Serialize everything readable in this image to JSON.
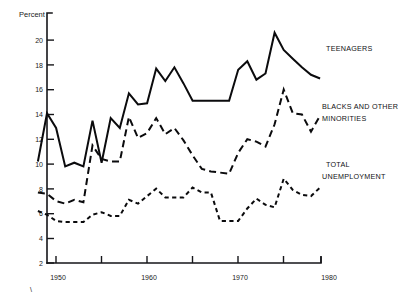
{
  "chart_data": {
    "type": "line",
    "title": "",
    "xlabel": "",
    "ylabel": "Percent",
    "xlim": [
      1948,
      1981
    ],
    "ylim": [
      2,
      21
    ],
    "grid": false,
    "legend_position": "inline-right-labels",
    "xticks": [
      1950,
      1955,
      1960,
      1965,
      1970,
      1975,
      1980
    ],
    "xticklabels": [
      "1950",
      "",
      "1960",
      "",
      "1970",
      "",
      "1980"
    ],
    "yticks": [
      2,
      4,
      6,
      8,
      10,
      12,
      14,
      16,
      18,
      20
    ],
    "yticklabels": [
      "2",
      "4",
      "6",
      "8",
      "10",
      "12",
      "14",
      "16",
      "18",
      "20"
    ],
    "x": [
      1948,
      1949,
      1950,
      1951,
      1952,
      1953,
      1954,
      1955,
      1956,
      1957,
      1958,
      1959,
      1960,
      1961,
      1962,
      1963,
      1964,
      1965,
      1966,
      1967,
      1968,
      1969,
      1970,
      1971,
      1972,
      1973,
      1974,
      1975,
      1976,
      1977,
      1978,
      1979
    ],
    "series": [
      {
        "name": "TEENAGERS",
        "style": "solid",
        "values": [
          10.2,
          14.1,
          12.9,
          9.8,
          10.1,
          9.8,
          13.5,
          10.1,
          13.7,
          12.9,
          15.7,
          14.8,
          14.9,
          17.7,
          16.7,
          17.8,
          16.5,
          15.1,
          15.1,
          15.1,
          15.1,
          15.1,
          17.6,
          18.3,
          16.8,
          17.3,
          20.6,
          19.2,
          18.5,
          17.8,
          17.2,
          16.9
        ],
        "label": "TEENAGERS"
      },
      {
        "name": "BLACKS AND OTHER MINORITIES",
        "style": "dashed-long",
        "values": [
          7.7,
          7.6,
          7.0,
          6.8,
          7.1,
          6.9,
          11.5,
          10.4,
          10.2,
          10.2,
          13.8,
          12.1,
          12.5,
          13.7,
          12.4,
          12.9,
          11.9,
          10.7,
          9.6,
          9.4,
          9.3,
          9.2,
          10.9,
          12.0,
          11.8,
          11.4,
          13.2,
          16.0,
          14.1,
          14.0,
          12.6,
          13.9
        ],
        "label_line1": "BLACKS AND OTHER",
        "label_line2": "MINORITIES"
      },
      {
        "name": "TOTAL UNEMPLOYMENT",
        "style": "dashed-short",
        "values": [
          6.2,
          5.9,
          5.4,
          5.3,
          5.3,
          5.3,
          5.9,
          6.1,
          5.8,
          5.8,
          7.1,
          6.8,
          7.4,
          8.0,
          7.3,
          7.3,
          7.3,
          8.1,
          7.7,
          7.7,
          5.4,
          5.4,
          5.4,
          6.4,
          7.2,
          6.7,
          6.5,
          8.8,
          7.9,
          7.5,
          7.4,
          8.1
        ],
        "label_line1": "TOTAL",
        "label_line2": "UNEMPLOYMENT"
      }
    ],
    "annotations": [
      {
        "text": "TEENAGERS",
        "x": 326,
        "y": 48
      },
      {
        "text": "BLACKS AND OTHER",
        "x": 322,
        "y": 106
      },
      {
        "text": "MINORITIES",
        "x": 322,
        "y": 118
      },
      {
        "text": "TOTAL",
        "x": 326,
        "y": 164
      },
      {
        "text": "UNEMPLOYMENT",
        "x": 322,
        "y": 176
      }
    ],
    "colors": {
      "line": "#0b0b0d",
      "axis": "#16161a",
      "text": "#1a1a1a",
      "background": "#ffffff"
    }
  },
  "axis": {
    "y_title": "Percent"
  },
  "marks": {
    "corner_tick": "\\"
  }
}
